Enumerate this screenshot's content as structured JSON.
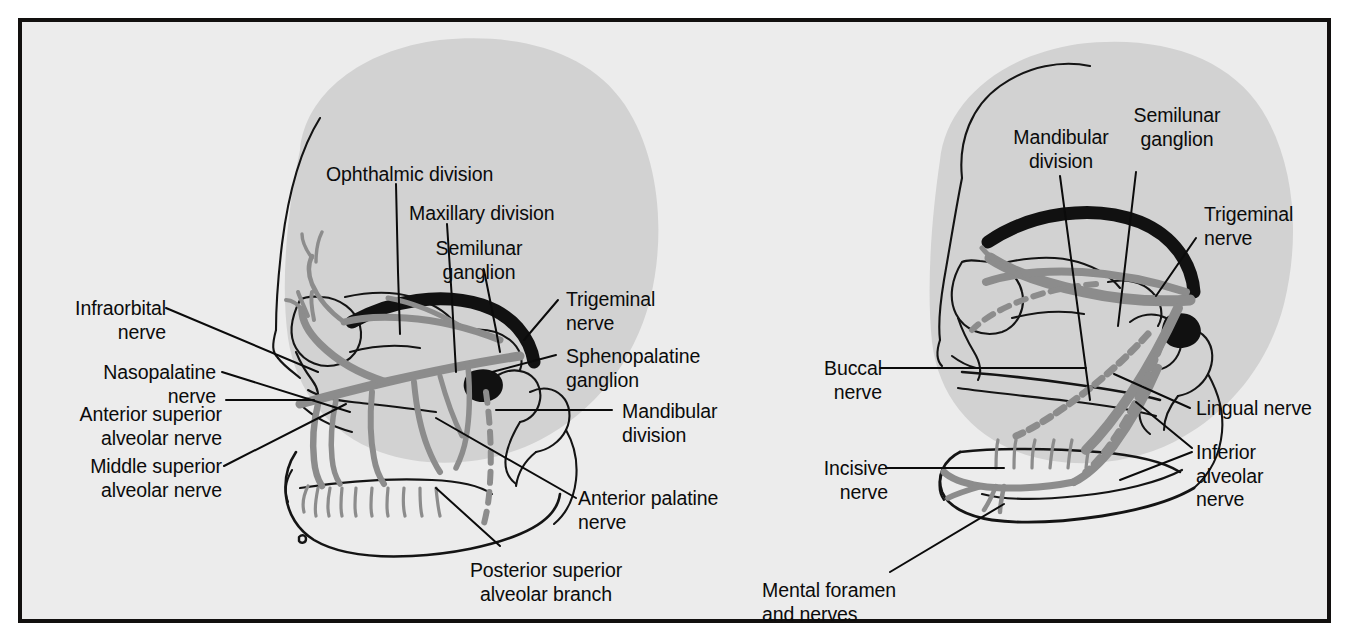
{
  "figure": {
    "panel_count": 2,
    "background_color": "#ececec",
    "frame_color": "#12100f",
    "head_silhouette_color": "#d2d2d2",
    "nerve_color": "#8c8c8c",
    "bone_outline_color": "#111111",
    "trunk_color": "#111111"
  },
  "left_panel": {
    "name": "maxillary-division-view",
    "labels": {
      "ophthalmic_division": "Ophthalmic division",
      "maxillary_division": "Maxillary division",
      "semilunar_ganglion": "Semilunar\nganglion",
      "trigeminal_nerve": "Trigeminal\nnerve",
      "sphenopalatine_ganglion": "Sphenopalatine\nganglion",
      "mandibular_division": "Mandibular\ndivision",
      "infraorbital_nerve": "Infraorbital\nnerve",
      "nasopalatine_nerve": "Nasopalatine\nnerve",
      "anterior_superior_alveolar_nerve": "Anterior superior\nalveolar nerve",
      "middle_superior_alveolar_nerve": "Middle superior\nalveolar nerve",
      "anterior_palatine_nerve": "Anterior palatine\nnerve",
      "posterior_superior_alveolar_branch": "Posterior superior\nalveolar branch"
    }
  },
  "right_panel": {
    "name": "mandibular-division-view",
    "labels": {
      "mandibular_division": "Mandibular\ndivision",
      "semilunar_ganglion": "Semilunar\nganglion",
      "trigeminal_nerve": "Trigeminal\nnerve",
      "buccal_nerve": "Buccal\nnerve",
      "lingual_nerve": "Lingual nerve",
      "inferior_alveolar_nerve": "Inferior\nalveolar\nnerve",
      "incisive_nerve": "Incisive\nnerve",
      "mental_foramen_and_nerves": "Mental foramen\nand nerves"
    }
  }
}
